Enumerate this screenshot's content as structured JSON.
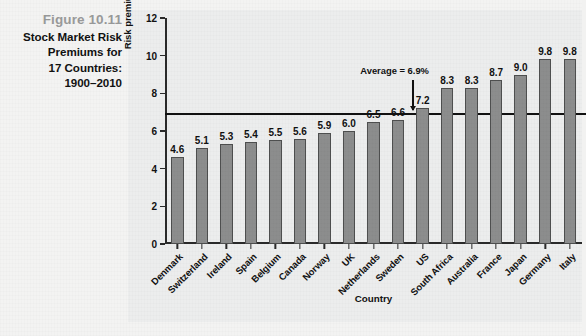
{
  "caption": {
    "figure_number": "Figure 10.11",
    "lines": [
      "Stock Market Risk",
      "Premiums for",
      "17 Countries:",
      "1900–2010"
    ]
  },
  "colors": {
    "bar_fill": "#8c8d8d",
    "bar_border": "#4e4f4f",
    "axis": "#2a2a2a",
    "average_line": "#111111",
    "panel_background": "#eceded",
    "figure_number": "#999a9a"
  },
  "annotation": {
    "average_label": "Average = 6.9%",
    "average_value": 6.9
  },
  "chart_data": {
    "type": "bar",
    "title": "Stock Market Risk Premiums for 17 Countries: 1900–2010",
    "xlabel": "Country",
    "ylabel": "Risk premium (% per year)",
    "ylim": [
      0,
      12
    ],
    "yticks": [
      0,
      2,
      4,
      6,
      8,
      10,
      12
    ],
    "grid": false,
    "legend": "none",
    "categories": [
      "Denmark",
      "Switzerland",
      "Ireland",
      "Spain",
      "Belgium",
      "Canada",
      "Norway",
      "UK",
      "Netherlands",
      "Sweden",
      "US",
      "South Africa",
      "Australia",
      "France",
      "Japan",
      "Germany",
      "Italy"
    ],
    "values": [
      4.6,
      5.1,
      5.3,
      5.4,
      5.5,
      5.6,
      5.9,
      6.0,
      6.5,
      6.6,
      7.2,
      8.3,
      8.3,
      8.7,
      9.0,
      9.8,
      9.8
    ],
    "value_labels": [
      "4.6",
      "5.1",
      "5.3",
      "5.4",
      "5.5",
      "5.6",
      "5.9",
      "6.0",
      "6.5",
      "6.6",
      "7.2",
      "8.3",
      "8.3",
      "8.7",
      "9.0",
      "9.8",
      "9.8"
    ],
    "reference_line": {
      "label": "Average = 6.9%",
      "value": 6.9
    }
  },
  "source_note": ""
}
